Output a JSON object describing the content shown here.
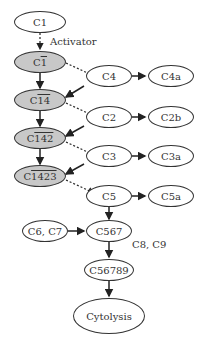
{
  "diagram": {
    "nodes": {
      "c1": {
        "prefix": "C1",
        "bar": ""
      },
      "c1_active": {
        "prefix": "C",
        "bar": "1"
      },
      "c14": {
        "prefix": "C",
        "bar": "14"
      },
      "c142": {
        "prefix": "C",
        "bar": "142"
      },
      "c1423": {
        "prefix": "C",
        "bar": "1423"
      },
      "c4": "C4",
      "c4a": "C4a",
      "c2": "C2",
      "c2b": "C2b",
      "c3": "C3",
      "c3a": "C3a",
      "c5": "C5",
      "c5a": "C5a",
      "c6c7": "C6, C7",
      "c567": "C567",
      "c56789": "C56789",
      "cytolysis": "Cytolysis"
    },
    "labels": {
      "activator": "Activator",
      "c8c9": "C8, C9"
    },
    "colors": {
      "active_fill": "#c8c8c8",
      "stroke": "#333333"
    }
  }
}
